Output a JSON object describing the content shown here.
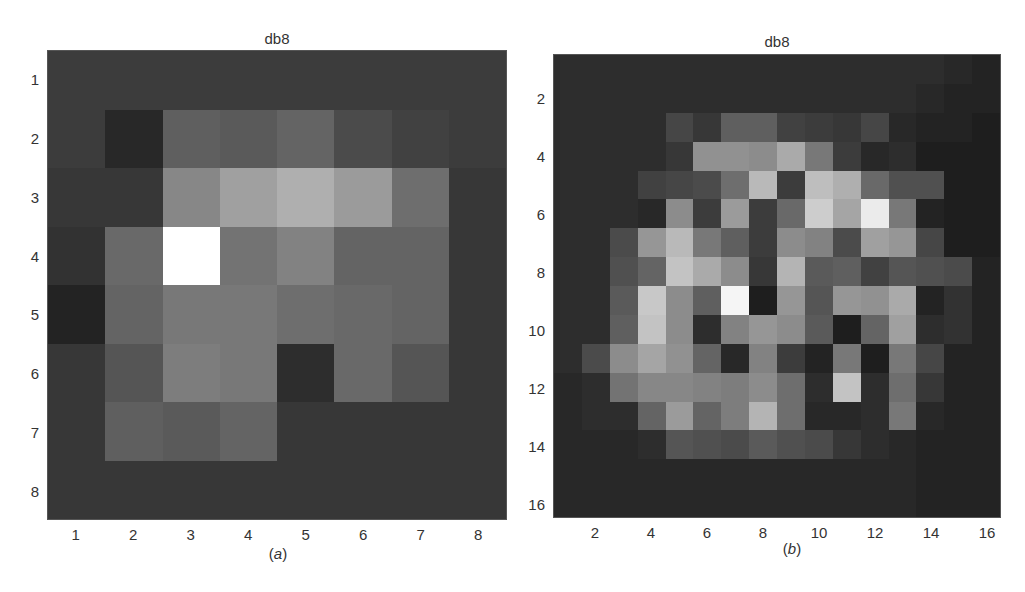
{
  "chart_data": [
    {
      "type": "heatmap",
      "title": "db8",
      "caption": "(a)",
      "colormap": "gray",
      "rows": 8,
      "cols": 8,
      "xticks": [
        1,
        2,
        3,
        4,
        5,
        6,
        7,
        8
      ],
      "yticks": [
        1,
        2,
        3,
        4,
        5,
        6,
        7,
        8
      ],
      "xlabel": "",
      "ylabel": "",
      "values": [
        [
          60,
          60,
          60,
          60,
          60,
          60,
          60,
          60
        ],
        [
          60,
          40,
          95,
          90,
          100,
          75,
          65,
          60
        ],
        [
          55,
          55,
          135,
          160,
          175,
          155,
          110,
          55
        ],
        [
          50,
          105,
          255,
          115,
          130,
          100,
          100,
          55
        ],
        [
          35,
          100,
          120,
          120,
          110,
          105,
          100,
          55
        ],
        [
          55,
          85,
          125,
          120,
          45,
          105,
          85,
          55
        ],
        [
          55,
          95,
          90,
          100,
          55,
          55,
          55,
          55
        ],
        [
          55,
          55,
          55,
          55,
          55,
          55,
          55,
          55
        ]
      ]
    },
    {
      "type": "heatmap",
      "title": "db8",
      "caption": "(b)",
      "colormap": "gray",
      "rows": 16,
      "cols": 16,
      "xticks": [
        2,
        4,
        6,
        8,
        10,
        12,
        14,
        16
      ],
      "yticks": [
        2,
        4,
        6,
        8,
        10,
        12,
        14,
        16
      ],
      "xlabel": "",
      "ylabel": "",
      "values": [
        [
          45,
          45,
          45,
          45,
          45,
          45,
          45,
          45,
          45,
          45,
          45,
          45,
          45,
          45,
          40,
          35
        ],
        [
          45,
          45,
          45,
          45,
          45,
          45,
          45,
          45,
          45,
          45,
          45,
          45,
          45,
          40,
          35,
          35
        ],
        [
          45,
          45,
          45,
          45,
          70,
          55,
          95,
          95,
          65,
          60,
          55,
          70,
          40,
          35,
          35,
          30
        ],
        [
          45,
          45,
          45,
          45,
          55,
          145,
          145,
          140,
          170,
          120,
          60,
          40,
          45,
          30,
          30,
          30
        ],
        [
          45,
          45,
          45,
          65,
          70,
          75,
          110,
          185,
          60,
          190,
          175,
          105,
          80,
          80,
          30,
          30
        ],
        [
          45,
          45,
          45,
          40,
          140,
          60,
          155,
          60,
          105,
          205,
          165,
          235,
          120,
          35,
          30,
          30
        ],
        [
          45,
          45,
          75,
          150,
          185,
          120,
          95,
          60,
          140,
          130,
          75,
          160,
          150,
          70,
          30,
          30
        ],
        [
          45,
          45,
          80,
          100,
          195,
          170,
          140,
          55,
          180,
          90,
          95,
          65,
          85,
          80,
          75,
          35
        ],
        [
          45,
          45,
          90,
          200,
          140,
          95,
          245,
          30,
          150,
          85,
          150,
          145,
          170,
          35,
          50,
          35
        ],
        [
          45,
          45,
          95,
          195,
          140,
          45,
          130,
          150,
          140,
          90,
          30,
          100,
          160,
          45,
          50,
          35
        ],
        [
          45,
          75,
          140,
          165,
          145,
          100,
          40,
          130,
          60,
          35,
          120,
          30,
          120,
          70,
          35,
          35
        ],
        [
          40,
          45,
          115,
          135,
          135,
          130,
          125,
          140,
          110,
          45,
          195,
          45,
          110,
          55,
          35,
          35
        ],
        [
          40,
          45,
          45,
          100,
          155,
          100,
          125,
          180,
          110,
          40,
          40,
          45,
          120,
          40,
          35,
          35
        ],
        [
          40,
          40,
          40,
          45,
          85,
          80,
          75,
          90,
          80,
          75,
          55,
          45,
          40,
          35,
          35,
          35
        ],
        [
          40,
          40,
          40,
          40,
          40,
          40,
          40,
          40,
          40,
          40,
          40,
          40,
          40,
          35,
          35,
          35
        ],
        [
          40,
          40,
          40,
          40,
          40,
          40,
          40,
          40,
          40,
          40,
          40,
          40,
          40,
          35,
          35,
          35
        ]
      ]
    }
  ],
  "panels": [
    {
      "title": "db8",
      "caption_open": "(",
      "caption_letter": "a",
      "caption_close": ")"
    },
    {
      "title": "db8",
      "caption_open": "(",
      "caption_letter": "b",
      "caption_close": ")"
    }
  ]
}
